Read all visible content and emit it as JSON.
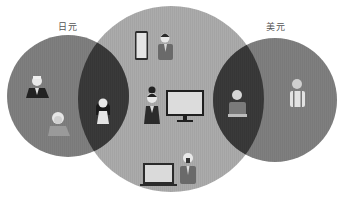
{
  "diagram": {
    "type": "venn",
    "circles": [
      {
        "id": "left",
        "label": "日元",
        "color": "#7f7f7f",
        "cx": 68,
        "cy": 96,
        "r": 61
      },
      {
        "id": "center",
        "label": "",
        "color": "#ababab",
        "cx": 171,
        "cy": 99,
        "r": 93
      },
      {
        "id": "right",
        "label": "美元",
        "color": "#7f7f7f",
        "cx": 275,
        "cy": 100,
        "r": 62
      }
    ],
    "overlap_color": "#3a3a3a",
    "regions": [
      {
        "region": "left-only",
        "items": [
          "person-man-dark-suit",
          "person-elderly-woman"
        ]
      },
      {
        "region": "left-center-overlap",
        "items": [
          "person-woman-long-hair"
        ]
      },
      {
        "region": "center-only",
        "items": [
          "smartphone",
          "person-man-suit-top",
          "person-woman-bun",
          "desktop-monitor",
          "laptop",
          "person-bald-man"
        ]
      },
      {
        "region": "center-right-overlap",
        "items": [
          "person-elderly-man-sweater"
        ]
      },
      {
        "region": "right-only",
        "items": [
          "person-man-suspenders"
        ]
      }
    ]
  },
  "labels": {
    "left": "日元",
    "right": "美元"
  }
}
